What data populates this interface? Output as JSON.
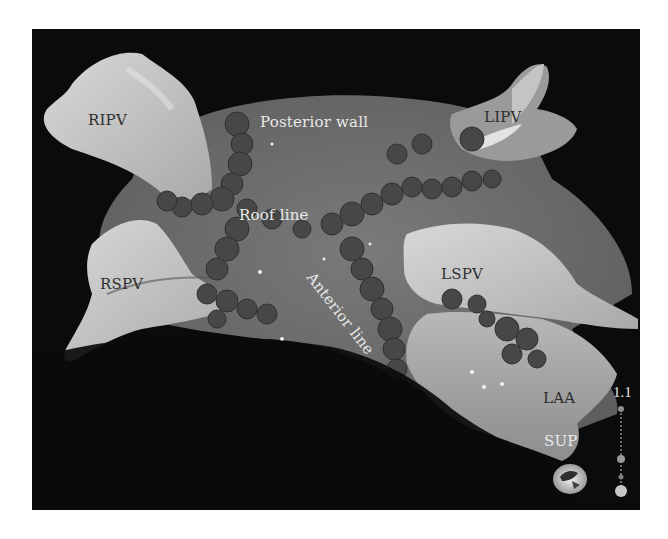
{
  "figure": {
    "labels": {
      "ripv": "RIPV",
      "lipv": "LIPV",
      "rspv": "RSPV",
      "lspv": "LSPV",
      "laa": "LAA",
      "posterior_wall": "Posterior wall",
      "roof_line": "Roof line",
      "anterior_line": "Anterior line"
    },
    "orientation": {
      "label": "SUP"
    },
    "scale": {
      "value": "1.1"
    },
    "colors": {
      "background": "#0b0b0b",
      "atrium_body": "#6f6f6f",
      "pv_highlight": "#c8c8c8",
      "lesion": "#484848",
      "page": "#ffffff"
    }
  }
}
